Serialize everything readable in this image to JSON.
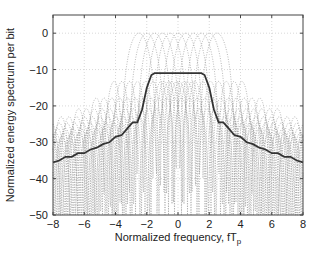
{
  "chart_data": {
    "type": "line",
    "title": "",
    "xlabel": "Normalized frequency, fT",
    "xlabel_subscript": "p",
    "ylabel": "Normalized energy spectrum per bit",
    "xlim": [
      -8,
      8
    ],
    "ylim": [
      -50,
      5
    ],
    "xticks": [
      -8,
      -6,
      -4,
      -2,
      0,
      2,
      4,
      6,
      8
    ],
    "yticks": [
      0,
      -10,
      -20,
      -30,
      -40,
      -50
    ],
    "grid": true,
    "legend": null,
    "series": [
      {
        "name": "Average spectrum",
        "style": "solid-bold",
        "color": "#333333",
        "x": [
          -8,
          -7.6,
          -7.2,
          -6.8,
          -6.4,
          -6.0,
          -5.6,
          -5.2,
          -4.8,
          -4.4,
          -4.0,
          -3.6,
          -3.2,
          -2.9,
          -2.6,
          -2.3,
          -2.0,
          -1.7,
          -1.5,
          -1.0,
          0,
          1.0,
          1.5,
          1.7,
          2.0,
          2.3,
          2.6,
          2.9,
          3.2,
          3.6,
          4.0,
          4.4,
          4.8,
          5.2,
          5.6,
          6.0,
          6.4,
          6.8,
          7.2,
          7.6,
          8
        ],
        "y": [
          -35.5,
          -35,
          -34,
          -34,
          -33,
          -33,
          -32,
          -31.5,
          -30.5,
          -30,
          -28.5,
          -28,
          -26,
          -24.5,
          -24.5,
          -21,
          -15,
          -11.5,
          -11,
          -11,
          -11,
          -11,
          -11,
          -11.5,
          -15,
          -21,
          -24.5,
          -24.5,
          -26,
          -28,
          -28.5,
          -30,
          -30.5,
          -31.5,
          -32,
          -33,
          -33,
          -34,
          -34,
          -35,
          -35.5
        ]
      },
      {
        "name": "Individual channel spectra",
        "style": "dotted",
        "color": "#9a9a9a",
        "count": 11,
        "peak_db": 0,
        "centers": [
          -2.5,
          -2.0,
          -1.5,
          -1.0,
          -0.5,
          0,
          0.5,
          1.0,
          1.5,
          2.0,
          2.5
        ],
        "sidelobe_floor_db": -50
      }
    ]
  },
  "axes": {
    "x_tick_labels": [
      "−8",
      "−6",
      "−4",
      "−2",
      "0",
      "2",
      "4",
      "6",
      "8"
    ],
    "y_tick_labels": [
      "0",
      "−10",
      "−20",
      "−30",
      "−40",
      "−50"
    ]
  }
}
